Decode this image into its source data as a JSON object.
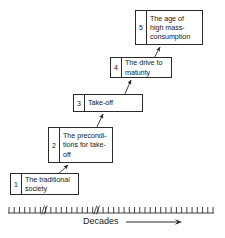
{
  "diagram": {
    "type": "stepped-stage-diagram",
    "stages": [
      {
        "number": "1",
        "label": "The traditional society"
      },
      {
        "number": "2",
        "label": "The precondi-tions for take-off"
      },
      {
        "number": "3",
        "label": "Take-off"
      },
      {
        "number": "4",
        "label": "The drive to maturity"
      },
      {
        "number": "5",
        "label": "The age of high mass-consumption"
      }
    ],
    "stage_lines": {
      "one": [
        "The traditional",
        "society"
      ],
      "two": [
        "The precondi-",
        "tions for take-",
        "off"
      ],
      "three": [
        "Take-off"
      ],
      "four": [
        "The drive to",
        "maturity"
      ],
      "five": [
        "The age of",
        "high mass-",
        "consumption"
      ]
    },
    "axis": {
      "caption": "Decades",
      "arrow_direction": "right",
      "tick_count": 40,
      "break_marks": 2,
      "orientation": "horizontal"
    },
    "connectors": {
      "count": 4,
      "style": "diagonal-arrow-up-right",
      "description": "arrow from each stage box up-right to the next stage box"
    },
    "colors": {
      "stroke": "#2b2b2b",
      "text": "#1a1a1a",
      "background": "#ffffff"
    }
  }
}
